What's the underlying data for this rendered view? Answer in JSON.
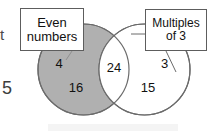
{
  "diagram": {
    "type": "venn-two-set",
    "title_visible": false,
    "background_color": "#ffffff",
    "left_set": {
      "label_lines": [
        "Even",
        "numbers"
      ],
      "fill_color": "#b0b0b0",
      "stroke_color": "#6b6b6b",
      "only_members": [
        "4",
        "16"
      ]
    },
    "right_set": {
      "label_lines": [
        "Multiples",
        "of 3"
      ],
      "fill_color": "#ffffff",
      "stroke_color": "#6b6b6b",
      "only_members": [
        "3",
        "15"
      ]
    },
    "intersection": {
      "fill_color": "#ffffff",
      "members": [
        "24"
      ]
    }
  },
  "numbers": {
    "even_only_top": "4",
    "even_only_bottom": "16",
    "intersection": "24",
    "mult_only_top": "3",
    "mult_only_bottom": "15"
  },
  "margin": {
    "cropped_letter": "t",
    "cropped_number": "5"
  }
}
